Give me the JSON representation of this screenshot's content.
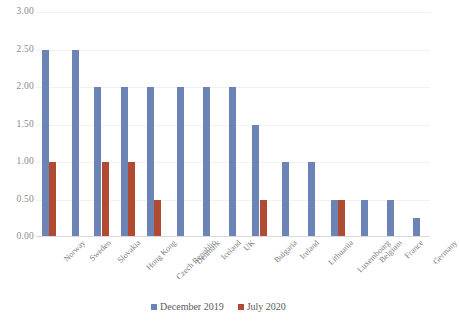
{
  "chart_data": {
    "type": "bar",
    "title": "",
    "subtitle": "",
    "xlabel": "",
    "ylabel": "",
    "ylim": [
      0,
      3.0
    ],
    "ytick_labels": [
      "3.00",
      "2.50",
      "2.00",
      "1.50",
      "1.00",
      "0.50",
      "0.00"
    ],
    "ytick_values": [
      3.0,
      2.5,
      2.0,
      1.5,
      1.0,
      0.5,
      0.0
    ],
    "grid": true,
    "legend_position": "bottom",
    "categories": [
      "Norway",
      "Sweden",
      "Slovakia",
      "Hong Kong",
      "Czech Republic",
      "Denmark",
      "Iceland",
      "UK",
      "Bulgaria",
      "Ireland",
      "Lithuania",
      "Luxembourg",
      "Belgium",
      "France",
      "Germany"
    ],
    "series": [
      {
        "name": "December 2019",
        "color": "#6b84b5",
        "values": [
          2.5,
          2.5,
          2.0,
          2.0,
          2.0,
          2.0,
          2.0,
          2.0,
          1.5,
          1.0,
          1.0,
          0.5,
          0.5,
          0.5,
          0.25
        ]
      },
      {
        "name": "July 2020",
        "color": "#b04a31",
        "values": [
          1.0,
          0,
          1.0,
          1.0,
          0.5,
          0,
          0,
          0,
          0.5,
          0,
          0,
          0.5,
          0,
          0,
          0
        ]
      }
    ]
  },
  "legend": {
    "items": [
      {
        "label": "December 2019",
        "color": "#6b84b5"
      },
      {
        "label": "July 2020",
        "color": "#b04a31"
      }
    ]
  }
}
